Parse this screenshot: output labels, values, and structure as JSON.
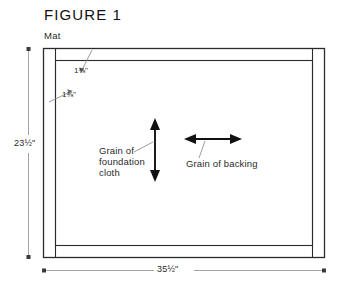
{
  "figure": {
    "title": "FIGURE 1",
    "part_label": "Mat"
  },
  "dimensions": {
    "height": "23½\"",
    "width": "35½\"",
    "top_inset": "1⅜\"",
    "left_inset": "1⅜\""
  },
  "annotations": {
    "grain_foundation": "Grain of\nfoundation\ncloth",
    "grain_backing": "Grain of backing"
  },
  "colors": {
    "ink": "#1a1a1a",
    "line": "#2b2b2b",
    "dimension_line": "#8a8a8a",
    "leader": "#8a8a8a",
    "background": "#ffffff"
  },
  "geometry": {
    "outer_rect": {
      "x": 43,
      "y": 48,
      "width": 282,
      "height": 210
    },
    "band_thickness": 12,
    "arrow_vertical": {
      "x": 155,
      "y1": 120,
      "y2": 180
    },
    "arrow_horizontal": {
      "y": 139,
      "x1": 186,
      "x2": 240
    }
  }
}
